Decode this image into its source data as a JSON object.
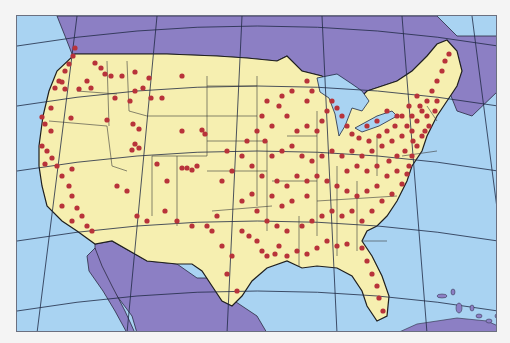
{
  "map": {
    "title": "",
    "region": "Contiguous United States",
    "colors": {
      "ocean": "#a9d3f2",
      "canada_mexico": "#8c7fc4",
      "us_land": "#f6efb0",
      "state_border": "#3a3a3a",
      "graticule": "#1f2a44",
      "dot": "#b8333a",
      "lake": "#a9d3f2",
      "background": "#f4f4f4"
    },
    "legend": [],
    "labels": []
  }
}
